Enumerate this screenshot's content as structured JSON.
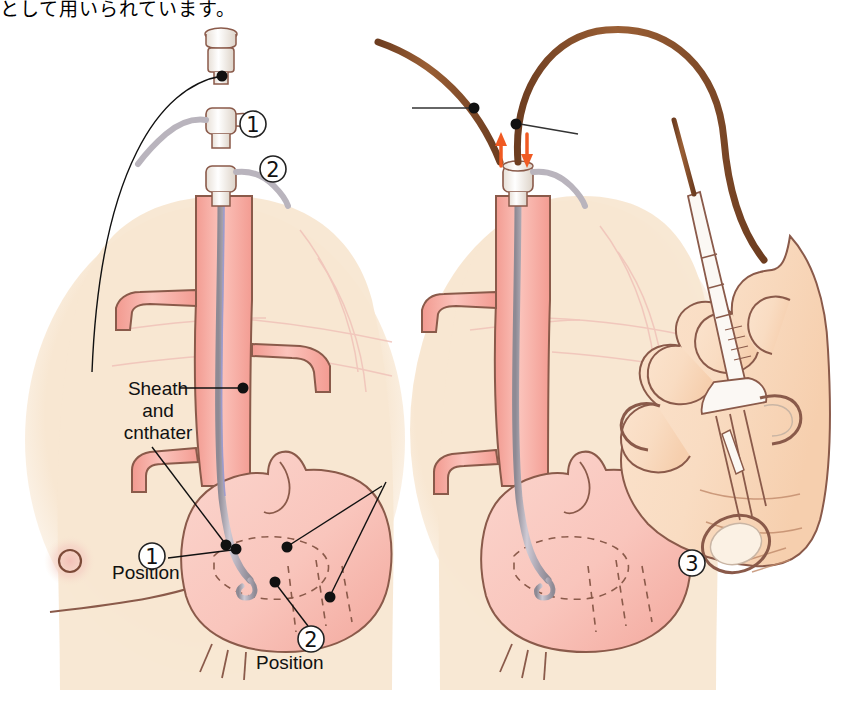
{
  "page": {
    "caption_jp": "として用いられています。",
    "width": 850,
    "height": 702
  },
  "colors": {
    "background": "#ffffff",
    "skin": "#f7e6d0",
    "skin_light": "#fbf1e2",
    "vessel_fill": "#f6aca2",
    "vessel_fill_light": "#fad4cd",
    "vessel_stroke": "#8a5a4a",
    "catheter_brown": "#8a5430",
    "catheter_grey": "#b9b4bd",
    "catheter_blue": "#9a9ad0",
    "arrow_orange": "#f05a22",
    "leader_black": "#111111",
    "rib_pink": "#f3c3bb",
    "nipple": "#8a5a4a",
    "hub_white": "#fdfbf8"
  },
  "panels": {
    "left": {
      "name": "sheath-and-catheter-placement",
      "labels": [
        {
          "id": "sheath-catheter",
          "text": "Sheath\nand\ncnthater",
          "x": 98,
          "y": 378
        },
        {
          "id": "position-1",
          "text": "Position",
          "x": 112,
          "y": 562
        },
        {
          "id": "position-2",
          "text": "Position",
          "x": 256,
          "y": 652
        }
      ],
      "markers": [
        {
          "id": "marker-1",
          "label": "1",
          "x": 253,
          "y": 124
        },
        {
          "id": "marker-2",
          "label": "2",
          "x": 273,
          "y": 169
        },
        {
          "id": "marker-position-1",
          "label": "1",
          "x": 152,
          "y": 556
        },
        {
          "id": "marker-position-2",
          "label": "2",
          "x": 311,
          "y": 639
        }
      ]
    },
    "right": {
      "name": "catheter-withdrawal-with-forceps",
      "markers": [
        {
          "id": "marker-3",
          "label": "3",
          "x": 692,
          "y": 563
        }
      ],
      "arrows": [
        {
          "id": "arrow-up",
          "direction": "up",
          "x": 501,
          "y": 148
        },
        {
          "id": "arrow-down",
          "direction": "down",
          "x": 524,
          "y": 148
        }
      ]
    }
  }
}
